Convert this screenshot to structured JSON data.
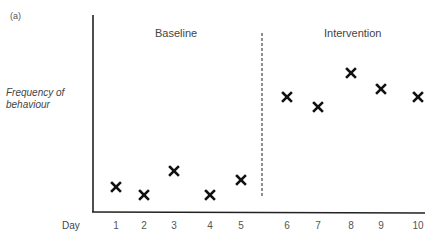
{
  "panel_label": "(a)",
  "chart_data": {
    "type": "scatter",
    "title": "",
    "xlabel": "Day",
    "ylabel": "Frequency of behaviour",
    "ylabel_lines": [
      "Frequency of",
      "behaviour"
    ],
    "grid": false,
    "legend": null,
    "marker": "x",
    "phases": [
      {
        "name": "Baseline",
        "days": [
          1,
          2,
          3,
          4,
          5
        ]
      },
      {
        "name": "Intervention",
        "days": [
          6,
          7,
          8,
          9,
          10
        ]
      }
    ],
    "phase_divider": {
      "between_days": [
        5,
        6
      ],
      "style": "dashed"
    },
    "x": [
      1,
      2,
      3,
      4,
      5,
      6,
      7,
      8,
      9,
      10
    ],
    "x_tick_labels": [
      "1",
      "2",
      "3",
      "4",
      "5",
      "6",
      "7",
      "8",
      "9",
      "10"
    ],
    "y_ticks": [],
    "ylim": [
      0,
      10
    ],
    "values": [
      1.3,
      0.9,
      2.1,
      0.9,
      1.6,
      5.8,
      5.3,
      7.0,
      6.2,
      5.8
    ],
    "annotations": [
      "Baseline",
      "Intervention"
    ]
  },
  "layout": {
    "tick_px": [
      116,
      144,
      174,
      210,
      241,
      287,
      318,
      351,
      381,
      418
    ],
    "point_px_y": [
      187,
      195,
      171,
      195,
      180,
      97,
      107,
      73,
      89,
      97
    ],
    "marker_color": "#111111",
    "axis_color": "#222222"
  }
}
